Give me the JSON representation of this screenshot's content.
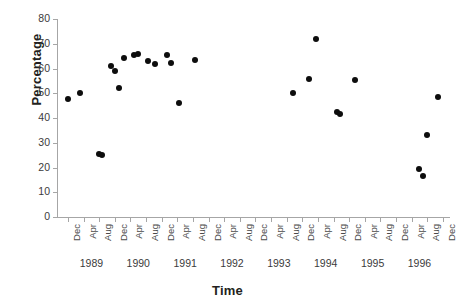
{
  "chart_data": {
    "type": "scatter",
    "title": "",
    "xlabel": "Time",
    "ylabel": "Percentage",
    "ylim": [
      0,
      80
    ],
    "yticks": [
      0,
      10,
      20,
      30,
      40,
      50,
      60,
      70,
      80
    ],
    "ytick_labels": [
      "0",
      "10",
      "20",
      "30",
      "40",
      "50",
      "60",
      "70",
      "80"
    ],
    "grid": false,
    "legend": null,
    "xtick_labels": [
      "Dec",
      "Apr",
      "Aug",
      "Dec",
      "Apr",
      "Aug",
      "Dec",
      "Apr",
      "Aug",
      "Dec",
      "Apr",
      "Aug",
      "Dec",
      "Apr",
      "Aug",
      "Dec",
      "Apr",
      "Aug",
      "Dec",
      "Apr",
      "Aug",
      "Dec",
      "Apr",
      "Aug",
      "Dec"
    ],
    "year_labels": [
      "1989",
      "1990",
      "1991",
      "1992",
      "1993",
      "1994",
      "1995",
      "1996"
    ],
    "marker": "filled-circle",
    "marker_color": "#0d0d0d",
    "points": [
      {
        "x": "Dec 1988",
        "xi": 0,
        "y": 47.5
      },
      {
        "x": "Mar 1989",
        "xi": 0.75,
        "y": 50.2
      },
      {
        "x": "Aug 1989",
        "xi": 2.0,
        "y": 25.3
      },
      {
        "x": "Sep 1989",
        "xi": 2.2,
        "y": 25.2
      },
      {
        "x": "Nov 1989",
        "xi": 2.75,
        "y": 61.0
      },
      {
        "x": "Dec 1989",
        "xi": 3.0,
        "y": 58.9
      },
      {
        "x": "Jan 1990",
        "xi": 3.25,
        "y": 52.3
      },
      {
        "x": "Feb 1990",
        "xi": 3.6,
        "y": 64.1
      },
      {
        "x": "Apr 1990",
        "xi": 4.2,
        "y": 65.6
      },
      {
        "x": "May 1990",
        "xi": 4.45,
        "y": 65.9
      },
      {
        "x": "Aug 1990",
        "xi": 5.1,
        "y": 63.0
      },
      {
        "x": "Oct 1990",
        "xi": 5.6,
        "y": 61.9
      },
      {
        "x": "Dec 1990",
        "xi": 6.35,
        "y": 65.4
      },
      {
        "x": "Jan 1991",
        "xi": 6.6,
        "y": 62.3
      },
      {
        "x": "Mar 1991",
        "xi": 7.1,
        "y": 45.9
      },
      {
        "x": "Aug 1991",
        "xi": 8.1,
        "y": 63.5
      },
      {
        "x": "Sep 1993",
        "xi": 14.4,
        "y": 50.0
      },
      {
        "x": "Jan 1994",
        "xi": 15.4,
        "y": 55.6
      },
      {
        "x": "Mar 1994",
        "xi": 15.9,
        "y": 72.0
      },
      {
        "x": "Oct 1994",
        "xi": 17.2,
        "y": 42.3
      },
      {
        "x": "Nov 1994",
        "xi": 17.4,
        "y": 41.7
      },
      {
        "x": "Apr 1995",
        "xi": 18.4,
        "y": 55.5
      },
      {
        "x": "Oct 1996",
        "xi": 22.5,
        "y": 19.5
      },
      {
        "x": "Nov 1996",
        "xi": 22.7,
        "y": 16.5
      },
      {
        "x": "Nov 1996b",
        "xi": 23.0,
        "y": 33.0
      },
      {
        "x": "Dec 1996",
        "xi": 23.7,
        "y": 48.3
      }
    ]
  }
}
